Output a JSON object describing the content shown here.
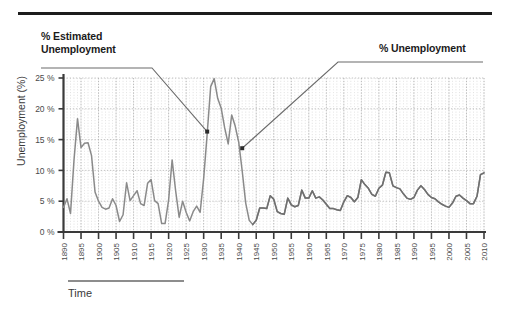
{
  "figure": {
    "annotation_left": "% Estimated\nUnemployment",
    "annotation_left_line1": "% Estimated",
    "annotation_left_line2": "Unemployment",
    "annotation_right": "% Unemployment",
    "x_axis_title": "Time",
    "y_axis_title": "Unemployment (%)"
  },
  "colors": {
    "line": "#8a8a8a",
    "line_dark": "#6f6f6f",
    "axis": "#3a3a3a",
    "grid": "#c9c9c9",
    "grid_major": "#b4b4b4",
    "text": "#3a3a3a",
    "rule": "#1d1d1d",
    "leader": "#6b6b6b"
  },
  "chart_data": {
    "type": "line",
    "title": "",
    "xlabel": "Time",
    "ylabel": "Unemployment (%)",
    "xlim": [
      1890,
      2010
    ],
    "ylim": [
      0,
      25
    ],
    "xtick_step": 5,
    "ytick_step": 5,
    "grid": true,
    "grid_minor_x_step": 1,
    "ytick_labels": [
      "0 %",
      "5 %",
      "10 %",
      "15 %",
      "20 %",
      "25 %"
    ],
    "ytick_values": [
      0,
      5,
      10,
      15,
      20,
      25
    ],
    "xtick_labels": [
      "1890",
      "1895",
      "1900",
      "1905",
      "1910",
      "1915",
      "1920",
      "1925",
      "1930",
      "1935",
      "1940",
      "1945",
      "1950",
      "1955",
      "1960",
      "1965",
      "1970",
      "1975",
      "1980",
      "1985",
      "1990",
      "1995",
      "2000",
      "2005",
      "2010"
    ],
    "xtick_values": [
      1890,
      1895,
      1900,
      1905,
      1910,
      1915,
      1920,
      1925,
      1930,
      1935,
      1940,
      1945,
      1950,
      1955,
      1960,
      1965,
      1970,
      1975,
      1980,
      1985,
      1990,
      1995,
      2000,
      2005,
      2010
    ],
    "annotations": [
      {
        "text": "% Estimated Unemployment",
        "points_to_year": 1931,
        "points_to_value": 16.3
      },
      {
        "text": "% Unemployment",
        "points_to_year": 1941,
        "points_to_value": 13.6
      }
    ],
    "series": [
      {
        "name": "Unemployment rate",
        "x": [
          1890,
          1891,
          1892,
          1893,
          1894,
          1895,
          1896,
          1897,
          1898,
          1899,
          1900,
          1901,
          1902,
          1903,
          1904,
          1905,
          1906,
          1907,
          1908,
          1909,
          1910,
          1911,
          1912,
          1913,
          1914,
          1915,
          1916,
          1917,
          1918,
          1919,
          1920,
          1921,
          1922,
          1923,
          1924,
          1925,
          1926,
          1927,
          1928,
          1929,
          1930,
          1931,
          1932,
          1933,
          1934,
          1935,
          1936,
          1937,
          1938,
          1939,
          1940,
          1941,
          1942,
          1943,
          1944,
          1945,
          1946,
          1947,
          1948,
          1949,
          1950,
          1951,
          1952,
          1953,
          1954,
          1955,
          1956,
          1957,
          1958,
          1959,
          1960,
          1961,
          1962,
          1963,
          1964,
          1965,
          1966,
          1967,
          1968,
          1969,
          1970,
          1971,
          1972,
          1973,
          1974,
          1975,
          1976,
          1977,
          1978,
          1979,
          1980,
          1981,
          1982,
          1983,
          1984,
          1985,
          1986,
          1987,
          1988,
          1989,
          1990,
          1991,
          1992,
          1993,
          1994,
          1995,
          1996,
          1997,
          1998,
          1999,
          2000,
          2001,
          2002,
          2003,
          2004,
          2005,
          2006,
          2007,
          2008,
          2009,
          2010
        ],
        "y": [
          4.0,
          5.4,
          3.0,
          11.7,
          18.4,
          13.7,
          14.4,
          14.5,
          12.4,
          6.5,
          5.0,
          4.0,
          3.7,
          3.9,
          5.4,
          4.3,
          1.7,
          2.8,
          8.0,
          5.1,
          5.9,
          6.7,
          4.6,
          4.3,
          7.9,
          8.5,
          5.1,
          4.6,
          1.4,
          1.4,
          5.2,
          11.7,
          6.7,
          2.4,
          5.0,
          3.2,
          1.8,
          3.3,
          4.2,
          3.2,
          8.7,
          15.9,
          23.6,
          24.9,
          21.7,
          20.1,
          16.9,
          14.3,
          19.0,
          17.2,
          14.6,
          9.9,
          4.7,
          1.9,
          1.2,
          1.9,
          3.9,
          3.9,
          3.8,
          5.9,
          5.3,
          3.3,
          3.0,
          2.9,
          5.5,
          4.4,
          4.1,
          4.3,
          6.8,
          5.5,
          5.5,
          6.7,
          5.5,
          5.7,
          5.2,
          4.5,
          3.8,
          3.8,
          3.6,
          3.5,
          4.9,
          5.9,
          5.6,
          4.9,
          5.6,
          8.5,
          7.7,
          7.1,
          6.1,
          5.8,
          7.1,
          7.6,
          9.7,
          9.6,
          7.5,
          7.2,
          7.0,
          6.2,
          5.5,
          5.3,
          5.6,
          6.8,
          7.5,
          6.9,
          6.1,
          5.6,
          5.4,
          4.9,
          4.5,
          4.2,
          4.0,
          4.7,
          5.8,
          6.0,
          5.5,
          5.1,
          4.6,
          4.6,
          5.8,
          9.3,
          9.6
        ]
      }
    ]
  }
}
